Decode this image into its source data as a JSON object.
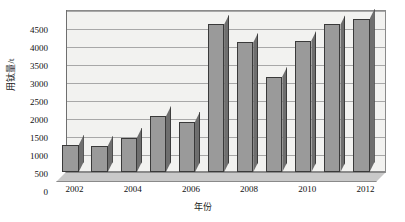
{
  "chart_data": {
    "type": "bar",
    "title": "",
    "xlabel": "年份",
    "ylabel": "用钛量/t",
    "categories": [
      "2002",
      "2003",
      "2004",
      "2005",
      "2006",
      "2007",
      "2008",
      "2009",
      "2010",
      "2011",
      "2012"
    ],
    "values": [
      750,
      720,
      950,
      1550,
      1400,
      4100,
      3600,
      2650,
      3650,
      4100,
      4250
    ],
    "ylim": [
      0,
      4500
    ],
    "ytick_step": 500,
    "yticks": [
      "0",
      "500",
      "1000",
      "1500",
      "2000",
      "2500",
      "3000",
      "3500",
      "4000",
      "4500"
    ],
    "xticks_shown": [
      "2002",
      "2004",
      "2006",
      "2008",
      "2010",
      "2012"
    ],
    "grid": true,
    "legend": false,
    "style": "3d-column",
    "colors": {
      "bar_front": "#9a9a9a",
      "bar_side": "#6e6e6e",
      "bar_top": "#b4b4b4",
      "bar_outline": "#3a3a3a",
      "plot_background": "#f2f2f0",
      "floor": "#c9c9c9",
      "gridline": "#a8a8a8",
      "axis": "#6f6f6f",
      "text": "#111111"
    }
  }
}
